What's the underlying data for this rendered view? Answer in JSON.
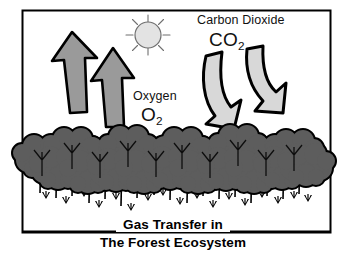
{
  "diagram": {
    "title_line_1": "Gas Transfer in",
    "title_line_2": "The Forest Ecosystem",
    "border_color": "#000000",
    "background_color": "#ffffff",
    "labels": {
      "carbon_dioxide_name": "Carbon Dioxide",
      "carbon_dioxide_formula": "CO",
      "carbon_dioxide_subscript": "2",
      "oxygen_name": "Oxygen",
      "oxygen_formula": "O",
      "oxygen_subscript": "2"
    },
    "elements": {
      "sun_name": "sun",
      "sun_fill": "#e3e3e3",
      "sun_outline": "#6f6f6f",
      "oxygen_arrow_fill": "#9a9a9a",
      "oxygen_arrow_outline": "#000000",
      "oxygen_arrow_direction": "up",
      "oxygen_arrow_count": "2",
      "co2_arrow_fill": "#d8d8d8",
      "co2_arrow_outline": "#000000",
      "co2_arrow_direction": "down",
      "co2_arrow_count": "2",
      "canopy_fill": "#5d5d5d",
      "canopy_outline": "#000000",
      "trunk_color": "#000000",
      "grass_color": "#000000"
    }
  }
}
